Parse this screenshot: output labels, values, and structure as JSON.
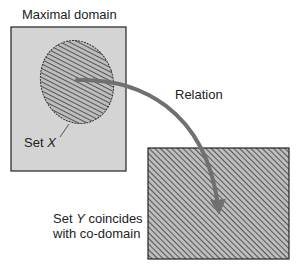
{
  "diagram": {
    "domain_label": "Maximal domain",
    "set_x_label_prefix": "Set ",
    "set_x_var": "X",
    "relation_label": "Relation",
    "set_y_line1_prefix": "Set ",
    "set_y_var": "Y",
    "set_y_line1_suffix": " coincides",
    "set_y_line2": "with co-domain"
  },
  "colors": {
    "domain_fill": "#d4d4d4",
    "hatch_dark": "#555555",
    "hatch_light": "#bdbdbd",
    "arrow": "#707070",
    "border": "#222222"
  }
}
